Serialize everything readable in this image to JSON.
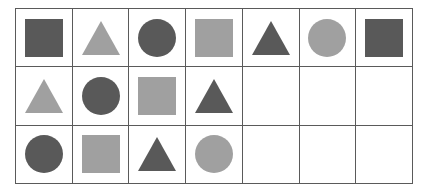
{
  "figure": {
    "type": "shape-grid",
    "background_color": "#ffffff",
    "grid_line_color": "#5a5a5a",
    "columns": 7,
    "rows": 3,
    "cell_width_px": 55.71,
    "cell_height_px": 57.33
  },
  "palette": {
    "dark": "#595959",
    "light": "#a0a0a0"
  },
  "shapes_legend": {
    "square": "square-shape",
    "circle": "circle-shape",
    "triangle": "triangle-shape",
    "empty": "empty-cell"
  },
  "chart_data": {
    "type": "table",
    "title": "",
    "xlabel": "",
    "ylabel": "",
    "columns": 7,
    "rows": 3,
    "grid": true,
    "cells": [
      [
        {
          "shape": "square",
          "tone": "dark",
          "color": "#595959"
        },
        {
          "shape": "triangle",
          "tone": "light",
          "color": "#a0a0a0"
        },
        {
          "shape": "circle",
          "tone": "dark",
          "color": "#595959"
        },
        {
          "shape": "square",
          "tone": "light",
          "color": "#a0a0a0"
        },
        {
          "shape": "triangle",
          "tone": "dark",
          "color": "#595959"
        },
        {
          "shape": "circle",
          "tone": "light",
          "color": "#a0a0a0"
        },
        {
          "shape": "square",
          "tone": "dark",
          "color": "#595959"
        }
      ],
      [
        {
          "shape": "triangle",
          "tone": "light",
          "color": "#a0a0a0"
        },
        {
          "shape": "circle",
          "tone": "dark",
          "color": "#595959"
        },
        {
          "shape": "square",
          "tone": "light",
          "color": "#a0a0a0"
        },
        {
          "shape": "triangle",
          "tone": "dark",
          "color": "#595959"
        },
        {
          "shape": "empty",
          "tone": "",
          "color": ""
        },
        {
          "shape": "empty",
          "tone": "",
          "color": ""
        },
        {
          "shape": "empty",
          "tone": "",
          "color": ""
        }
      ],
      [
        {
          "shape": "circle",
          "tone": "dark",
          "color": "#595959"
        },
        {
          "shape": "square",
          "tone": "light",
          "color": "#a0a0a0"
        },
        {
          "shape": "triangle",
          "tone": "dark",
          "color": "#595959"
        },
        {
          "shape": "circle",
          "tone": "light",
          "color": "#a0a0a0"
        },
        {
          "shape": "empty",
          "tone": "",
          "color": ""
        },
        {
          "shape": "empty",
          "tone": "",
          "color": ""
        },
        {
          "shape": "empty",
          "tone": "",
          "color": ""
        }
      ]
    ],
    "counts": {
      "square": 5,
      "circle": 5,
      "triangle": 5,
      "empty": 6,
      "dark": 8,
      "light": 7
    }
  }
}
